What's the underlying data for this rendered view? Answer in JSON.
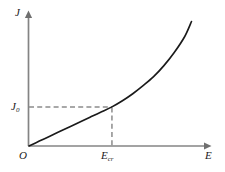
{
  "figure": {
    "axes": {
      "y_axis_label": "J",
      "x_axis_label": "E",
      "origin_label": "O"
    },
    "annotations": {
      "y_threshold_symbol": "J",
      "y_threshold_subscript": "0",
      "x_threshold_symbol": "E",
      "x_threshold_subscript": "cr"
    },
    "colors": {
      "curve": "#1a1a1a",
      "axis": "#848484",
      "guide": "#8c8c8c",
      "background": "#ffffff"
    }
  },
  "chart_data": {
    "type": "line",
    "title": "",
    "xlabel": "E",
    "ylabel": "J",
    "grid": false,
    "legend": false,
    "axis_style": "arrow-headed half-axes through origin",
    "xlim": [
      0,
      1
    ],
    "ylim": [
      0,
      1
    ],
    "x_tick_labels": [
      "O",
      "E_cr"
    ],
    "y_tick_labels": [
      "J_0"
    ],
    "annotations": [
      {
        "label": "J_0",
        "axis": "y",
        "value": 0.295,
        "guide": "dashed horizontal from y-axis to curve"
      },
      {
        "label": "E_cr",
        "axis": "x",
        "value": 0.466,
        "guide": "dashed vertical from curve down to x-axis"
      }
    ],
    "series": [
      {
        "name": "J(E)",
        "x": [
          0.0,
          0.058,
          0.117,
          0.175,
          0.233,
          0.292,
          0.35,
          0.408,
          0.466,
          0.525,
          0.583,
          0.641,
          0.7,
          0.758,
          0.816,
          0.875,
          0.913
        ],
        "y": [
          0.0,
          0.037,
          0.074,
          0.111,
          0.148,
          0.185,
          0.222,
          0.258,
          0.295,
          0.341,
          0.394,
          0.455,
          0.523,
          0.606,
          0.705,
          0.826,
          0.939
        ]
      }
    ]
  }
}
